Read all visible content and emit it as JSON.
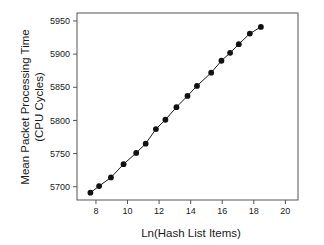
{
  "chart_data": {
    "type": "line",
    "title": "",
    "xlabel": "Ln(Hash List Items)",
    "ylabel_line1": "Mean Packet Processing Time",
    "ylabel_line2": "(CPU Cycles)",
    "xlim": [
      6.8,
      20.8
    ],
    "ylim": [
      5680,
      5962
    ],
    "xticks": [
      8,
      10,
      12,
      14,
      16,
      18,
      20
    ],
    "xtick_labels": [
      "8",
      "10",
      "12",
      "14",
      "16",
      "18",
      "20"
    ],
    "yticks": [
      5700,
      5750,
      5800,
      5850,
      5900,
      5950
    ],
    "ytick_labels": [
      "5700",
      "5750",
      "5800",
      "5850",
      "5900",
      "5950"
    ],
    "grid": false,
    "legend": "none",
    "marker": "filled-circle",
    "line_color": "#1a1a1a",
    "marker_color": "#111111",
    "frame_color": "#555555",
    "series": [
      {
        "name": "Mean Packet Processing Time",
        "x": [
          7.65,
          8.2,
          8.95,
          9.75,
          10.55,
          11.15,
          11.8,
          12.4,
          13.1,
          13.8,
          14.4,
          15.3,
          15.95,
          16.5,
          17.05,
          17.75,
          18.45
        ],
        "y": [
          5691,
          5701,
          5714,
          5734,
          5751,
          5765,
          5787,
          5801,
          5820,
          5837,
          5852,
          5872,
          5890,
          5902,
          5915,
          5931,
          5941
        ]
      }
    ]
  }
}
